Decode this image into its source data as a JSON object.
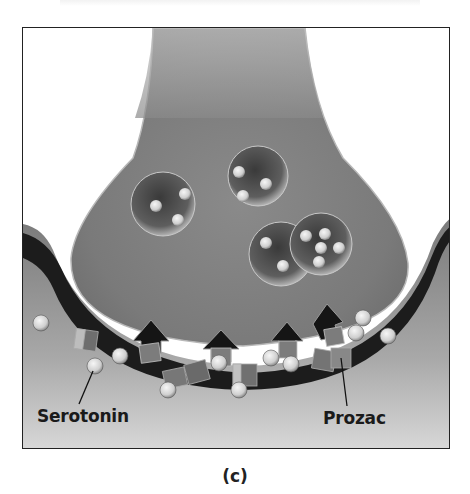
{
  "figure": {
    "panel_label": "(c)",
    "labels": {
      "serotonin": "Serotonin",
      "prozac": "Prozac"
    },
    "colors": {
      "terminal": "#8c8c8c",
      "cleft": "#1e1e1e",
      "postsynaptic": "#a8a8a8",
      "molecule": "#e6e6e6",
      "border": "#222222"
    }
  }
}
